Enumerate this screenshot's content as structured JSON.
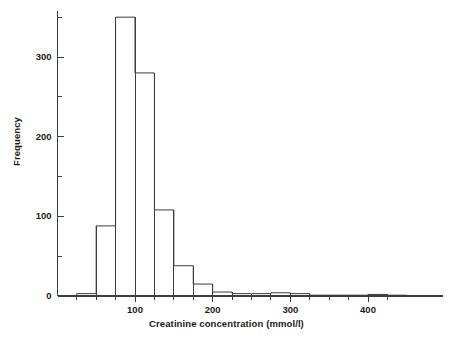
{
  "chart_data": {
    "type": "bar",
    "title": "",
    "subtitle": "",
    "xlabel": "Creatinine concentration (mmol/l)",
    "ylabel": "Frequency",
    "grid": false,
    "legend": "none",
    "xlim": [
      18,
      450
    ],
    "ylim": [
      0,
      365
    ],
    "xticks": [
      100,
      200,
      300,
      400
    ],
    "xtick_labels": [
      "100",
      "200",
      "300",
      "400"
    ],
    "xminor_ticks": [
      25,
      50,
      75,
      125,
      150,
      175,
      225,
      250,
      275,
      325,
      350,
      375,
      425
    ],
    "yticks": [
      0,
      100,
      200,
      300
    ],
    "ytick_labels": [
      "0",
      "100",
      "200",
      "300"
    ],
    "yminor_ticks": [
      50,
      150,
      250,
      350
    ],
    "bin_width": 25,
    "bin_edges": [
      25,
      50,
      75,
      100,
      125,
      150,
      175,
      200,
      225,
      250,
      275,
      300,
      325,
      350,
      375,
      400,
      425,
      450
    ],
    "categories": [
      "25-50",
      "50-75",
      "75-100",
      "100-125",
      "125-150",
      "150-175",
      "175-200",
      "200-225",
      "225-250",
      "250-275",
      "275-300",
      "300-325",
      "325-350",
      "350-375",
      "375-400",
      "400-425",
      "425-450"
    ],
    "values": [
      3,
      88,
      350,
      280,
      108,
      38,
      15,
      5,
      3,
      3,
      4,
      3,
      1,
      1,
      1,
      2,
      1
    ]
  }
}
